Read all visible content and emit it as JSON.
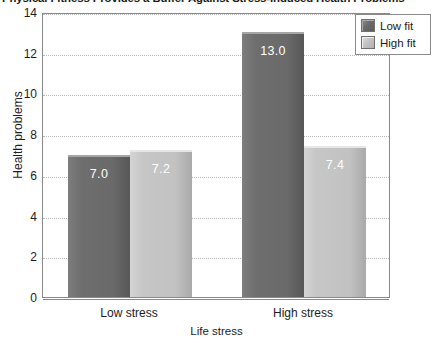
{
  "chart_data": {
    "type": "bar",
    "title": "Physical Fitness Provides a Buffer Against Stress-Induced Health Problems",
    "xlabel": "Life stress",
    "ylabel": "Health problems",
    "categories": [
      "Low stress",
      "High stress"
    ],
    "series": [
      {
        "name": "Low fit",
        "color": "#6e6e6e",
        "values": [
          7.0,
          13.0
        ],
        "labels": [
          "7.0",
          "13.0"
        ]
      },
      {
        "name": "High fit",
        "color": "#c6c6c6",
        "values": [
          7.2,
          7.4
        ],
        "labels": [
          "7.2",
          "7.4"
        ]
      }
    ],
    "ylim": [
      0,
      14
    ],
    "yticks": [
      0,
      2,
      4,
      6,
      8,
      10,
      12,
      14
    ],
    "ytick_labels": [
      "0",
      "2",
      "4",
      "6",
      "8",
      "10",
      "12",
      "14"
    ],
    "grid": true,
    "grid_axis": "y",
    "legend_position": "top-right",
    "legend": [
      "Low fit",
      "High fit"
    ]
  }
}
